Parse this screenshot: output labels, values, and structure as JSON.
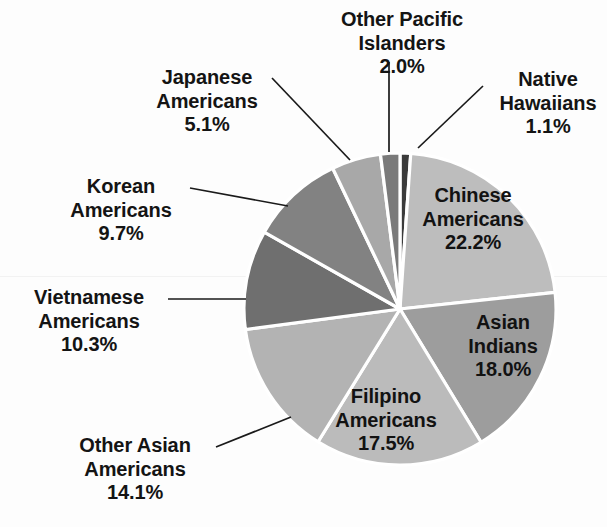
{
  "chart_data": {
    "type": "pie",
    "title": "",
    "subtitle": "",
    "xlabel": "",
    "ylabel": "",
    "legend_position": "none",
    "grid": false,
    "units": "percent",
    "total": 100.0,
    "start_angle_deg": 0,
    "direction": "clockwise",
    "categories": [
      "Native Hawaiians",
      "Chinese Americans",
      "Asian Indians",
      "Filipino Americans",
      "Other Asian Americans",
      "Vietnamese Americans",
      "Korean Americans",
      "Japanese Americans",
      "Other Pacific Islanders"
    ],
    "values": [
      1.1,
      22.2,
      18.0,
      17.5,
      14.1,
      10.3,
      9.7,
      5.1,
      2.0
    ],
    "slices": [
      {
        "name": "Native Hawaiians",
        "label_line1": "Native",
        "label_line2": "Hawaiians",
        "value": 1.1,
        "percent_text": "1.1%",
        "color": "#3b3b3b",
        "label_placement": "outside",
        "leader_line": true
      },
      {
        "name": "Chinese Americans",
        "label_line1": "Chinese",
        "label_line2": "Americans",
        "value": 22.2,
        "percent_text": "22.2%",
        "color": "#bdbdbd",
        "label_placement": "inside",
        "leader_line": false
      },
      {
        "name": "Asian Indians",
        "label_line1": "Asian",
        "label_line2": "Indians",
        "value": 18.0,
        "percent_text": "18.0%",
        "color": "#9d9d9d",
        "label_placement": "inside",
        "leader_line": false
      },
      {
        "name": "Filipino Americans",
        "label_line1": "Filipino",
        "label_line2": "Americans",
        "value": 17.5,
        "percent_text": "17.5%",
        "color": "#bbbbbb",
        "label_placement": "inside",
        "leader_line": false
      },
      {
        "name": "Other Asian Americans",
        "label_line1": "Other Asian",
        "label_line2": "Americans",
        "value": 14.1,
        "percent_text": "14.1%",
        "color": "#b3b3b3",
        "label_placement": "outside",
        "leader_line": true
      },
      {
        "name": "Vietnamese Americans",
        "label_line1": "Vietnamese",
        "label_line2": "Americans",
        "value": 10.3,
        "percent_text": "10.3%",
        "color": "#6f6f6f",
        "label_placement": "outside",
        "leader_line": true
      },
      {
        "name": "Korean Americans",
        "label_line1": "Korean",
        "label_line2": "Americans",
        "value": 9.7,
        "percent_text": "9.7%",
        "color": "#828282",
        "label_placement": "outside",
        "leader_line": true
      },
      {
        "name": "Japanese Americans",
        "label_line1": "Japanese",
        "label_line2": "Americans",
        "value": 5.1,
        "percent_text": "5.1%",
        "color": "#a8a8a8",
        "label_placement": "outside",
        "leader_line": true
      },
      {
        "name": "Other Pacific Islanders",
        "label_line1": "Other Pacific",
        "label_line2": "Islanders",
        "value": 2.0,
        "percent_text": "2.0%",
        "color": "#7a7a7a",
        "label_placement": "outside",
        "leader_line": true
      }
    ]
  },
  "style": {
    "background": "#fdfdfd",
    "slice_separator_color": "#ffffff",
    "text_color": "#141414"
  }
}
